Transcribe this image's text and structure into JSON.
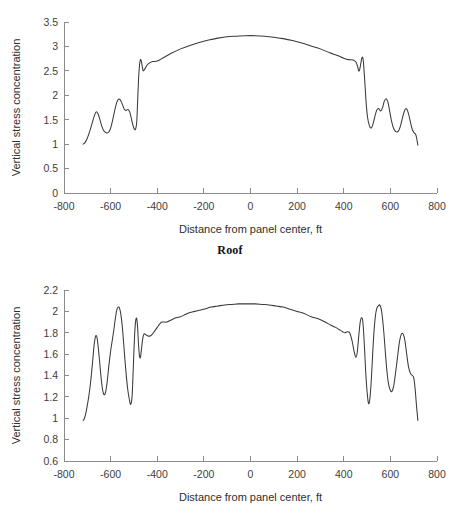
{
  "page": {
    "background_color": "#ffffff",
    "line_color": "#3a3a3a",
    "axis_color": "#8c8c8c"
  },
  "roof": {
    "caption": "Roof",
    "xlabel": "Distance from panel center, ft",
    "ylabel": "Vertical stress concentration"
  },
  "floor": {
    "caption": "Floor",
    "xlabel": "Distance from panel center, ft",
    "ylabel": "Vertical stress concentration"
  },
  "chart_data": [
    {
      "id": "roof",
      "type": "line",
      "title": "Roof",
      "xlabel": "Distance from panel center, ft",
      "ylabel": "Vertical stress concentration",
      "xlim": [
        -800,
        800
      ],
      "ylim": [
        0,
        3.5
      ],
      "xticks": [
        -800,
        -600,
        -400,
        -200,
        0,
        200,
        400,
        600,
        800
      ],
      "xtick_labels": [
        "-800",
        "-600",
        "-400",
        "-200",
        "0",
        "200",
        "400",
        "600",
        "800"
      ],
      "yticks": [
        0,
        0.5,
        1,
        1.5,
        2,
        2.5,
        3,
        3.5
      ],
      "ytick_labels": [
        "0",
        "0.5",
        "1",
        "1.5",
        "2",
        "2.5",
        "3",
        "3.5"
      ],
      "grid": false,
      "legend": null,
      "series": [
        {
          "name": "Vertical stress concentration (roof)",
          "x": [
            -718,
            -710,
            -702,
            -694,
            -686,
            -678,
            -670,
            -662,
            -654,
            -646,
            -638,
            -630,
            -622,
            -614,
            -606,
            -598,
            -590,
            -582,
            -574,
            -566,
            -558,
            -550,
            -542,
            -534,
            -526,
            -518,
            -510,
            -502,
            -494,
            -488,
            -484,
            -480,
            -476,
            -472,
            -468,
            -464,
            -460,
            -452,
            -440,
            -420,
            -400,
            -370,
            -340,
            -300,
            -260,
            -220,
            -180,
            -140,
            -100,
            -60,
            -20,
            20,
            60,
            100,
            140,
            180,
            220,
            260,
            300,
            340,
            370,
            400,
            420,
            440,
            452,
            460,
            464,
            468,
            472,
            476,
            480,
            484,
            490,
            496,
            502,
            510,
            518,
            526,
            534,
            542,
            550,
            558,
            566,
            574,
            582,
            590,
            598,
            606,
            614,
            622,
            630,
            638,
            646,
            654,
            662,
            670,
            678,
            686,
            694,
            702,
            710,
            718
          ],
          "y": [
            1.0,
            1.03,
            1.1,
            1.2,
            1.32,
            1.45,
            1.58,
            1.66,
            1.62,
            1.5,
            1.37,
            1.28,
            1.24,
            1.23,
            1.26,
            1.36,
            1.52,
            1.7,
            1.85,
            1.92,
            1.9,
            1.82,
            1.72,
            1.69,
            1.71,
            1.66,
            1.5,
            1.35,
            1.3,
            1.46,
            1.9,
            2.35,
            2.62,
            2.73,
            2.69,
            2.58,
            2.5,
            2.55,
            2.64,
            2.69,
            2.7,
            2.78,
            2.86,
            2.95,
            3.02,
            3.08,
            3.13,
            3.17,
            3.2,
            3.21,
            3.22,
            3.22,
            3.21,
            3.19,
            3.16,
            3.12,
            3.07,
            3.01,
            2.95,
            2.87,
            2.82,
            2.76,
            2.73,
            2.72,
            2.68,
            2.58,
            2.5,
            2.52,
            2.62,
            2.73,
            2.78,
            2.7,
            2.3,
            1.85,
            1.55,
            1.38,
            1.33,
            1.42,
            1.58,
            1.7,
            1.73,
            1.68,
            1.74,
            1.88,
            1.93,
            1.85,
            1.65,
            1.45,
            1.32,
            1.26,
            1.25,
            1.3,
            1.42,
            1.58,
            1.7,
            1.72,
            1.62,
            1.45,
            1.3,
            1.23,
            1.18,
            0.98
          ]
        }
      ]
    },
    {
      "id": "floor",
      "type": "line",
      "title": "Floor",
      "xlabel": "Distance from panel center, ft",
      "ylabel": "Vertical stress concentration",
      "xlim": [
        -800,
        800
      ],
      "ylim": [
        0.6,
        2.2
      ],
      "xticks": [
        -800,
        -600,
        -400,
        -200,
        0,
        200,
        400,
        600,
        800
      ],
      "xtick_labels": [
        "-800",
        "-600",
        "-400",
        "-200",
        "0",
        "200",
        "400",
        "600",
        "800"
      ],
      "yticks": [
        0.6,
        0.8,
        1.0,
        1.2,
        1.4,
        1.6,
        1.8,
        2.0,
        2.2
      ],
      "ytick_labels": [
        "0.6",
        "0.8",
        "1",
        "1.2",
        "1.4",
        "1.6",
        "1.8",
        "2",
        "2.2"
      ],
      "grid": false,
      "legend": null,
      "series": [
        {
          "name": "Vertical stress concentration (floor)",
          "x": [
            -718,
            -712,
            -706,
            -700,
            -694,
            -688,
            -682,
            -676,
            -670,
            -664,
            -658,
            -652,
            -646,
            -640,
            -634,
            -628,
            -622,
            -616,
            -610,
            -604,
            -598,
            -592,
            -586,
            -580,
            -574,
            -568,
            -562,
            -556,
            -550,
            -544,
            -538,
            -532,
            -526,
            -520,
            -514,
            -508,
            -504,
            -500,
            -496,
            -492,
            -488,
            -484,
            -480,
            -476,
            -472,
            -468,
            -462,
            -456,
            -448,
            -440,
            -430,
            -420,
            -410,
            -400,
            -390,
            -380,
            -360,
            -340,
            -320,
            -300,
            -280,
            -260,
            -240,
            -220,
            -200,
            -170,
            -140,
            -110,
            -80,
            -50,
            -20,
            20,
            50,
            80,
            110,
            140,
            170,
            200,
            230,
            260,
            290,
            320,
            345,
            365,
            380,
            395,
            405,
            415,
            425,
            435,
            445,
            452,
            458,
            464,
            470,
            476,
            482,
            488,
            494,
            500,
            506,
            512,
            518,
            524,
            530,
            536,
            542,
            548,
            554,
            560,
            566,
            572,
            578,
            584,
            590,
            598,
            606,
            614,
            622,
            630,
            638,
            646,
            654,
            662,
            670,
            678,
            686,
            694,
            700,
            706,
            712,
            718
          ],
          "y": [
            0.98,
            1.0,
            1.05,
            1.12,
            1.2,
            1.3,
            1.42,
            1.56,
            1.7,
            1.77,
            1.75,
            1.64,
            1.5,
            1.36,
            1.26,
            1.22,
            1.24,
            1.32,
            1.44,
            1.56,
            1.66,
            1.74,
            1.83,
            1.93,
            2.01,
            2.04,
            2.03,
            1.97,
            1.86,
            1.7,
            1.53,
            1.38,
            1.26,
            1.18,
            1.13,
            1.2,
            1.4,
            1.63,
            1.82,
            1.92,
            1.93,
            1.84,
            1.68,
            1.58,
            1.57,
            1.64,
            1.75,
            1.79,
            1.78,
            1.77,
            1.77,
            1.79,
            1.82,
            1.85,
            1.88,
            1.9,
            1.9,
            1.92,
            1.94,
            1.95,
            1.97,
            1.99,
            2.0,
            2.01,
            2.02,
            2.04,
            2.05,
            2.06,
            2.065,
            2.07,
            2.07,
            2.07,
            2.065,
            2.06,
            2.05,
            2.04,
            2.02,
            2.0,
            1.98,
            1.95,
            1.93,
            1.9,
            1.87,
            1.85,
            1.83,
            1.81,
            1.8,
            1.81,
            1.8,
            1.73,
            1.62,
            1.57,
            1.62,
            1.76,
            1.89,
            1.94,
            1.9,
            1.7,
            1.44,
            1.25,
            1.14,
            1.18,
            1.35,
            1.6,
            1.82,
            1.96,
            2.03,
            2.05,
            2.06,
            2.03,
            1.94,
            1.8,
            1.63,
            1.47,
            1.35,
            1.27,
            1.25,
            1.3,
            1.42,
            1.56,
            1.7,
            1.78,
            1.79,
            1.73,
            1.6,
            1.48,
            1.42,
            1.4,
            1.38,
            1.28,
            1.12,
            0.98,
            0.88
          ]
        }
      ]
    }
  ]
}
